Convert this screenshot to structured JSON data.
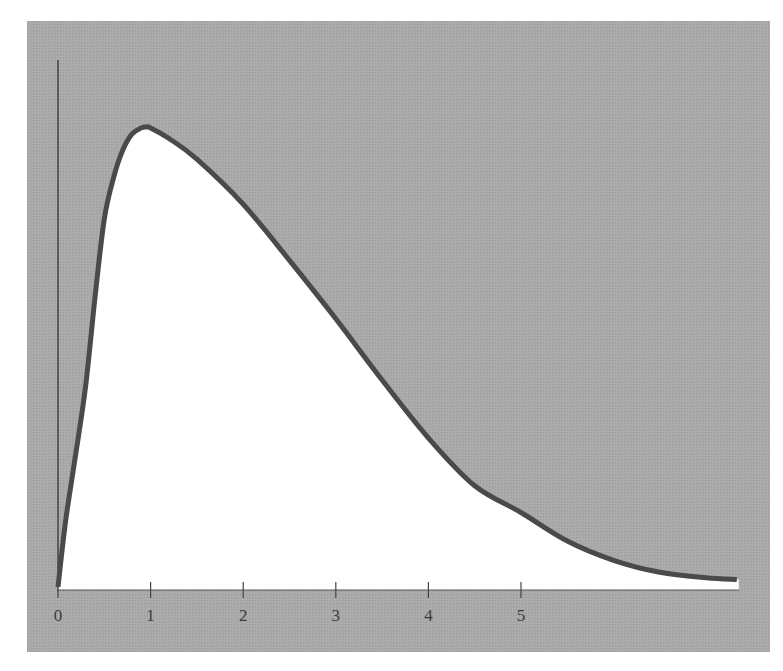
{
  "chart_data": {
    "type": "line",
    "title": "",
    "xlabel": "",
    "ylabel": "",
    "xlim": [
      0,
      7.35
    ],
    "ylim": [
      0,
      1.0
    ],
    "grid": false,
    "legend": null,
    "x_ticks": [
      0,
      1,
      2,
      3,
      4,
      5
    ],
    "x_tick_labels": [
      "0",
      "1",
      "2",
      "3",
      "4",
      "5"
    ],
    "y_ticks": [],
    "series": [
      {
        "name": "density curve (relative height, peak = 1)",
        "x": [
          0,
          0.05,
          0.1,
          0.2,
          0.3,
          0.4,
          0.5,
          0.6,
          0.7,
          0.8,
          0.9,
          0.95,
          1.0,
          1.2,
          1.5,
          2.0,
          2.5,
          3.0,
          3.5,
          4.0,
          4.5,
          5.0,
          5.5,
          6.0,
          6.5,
          7.0,
          7.33
        ],
        "y": [
          0,
          0.09,
          0.17,
          0.3,
          0.44,
          0.63,
          0.8,
          0.89,
          0.95,
          0.985,
          0.998,
          1.0,
          0.998,
          0.975,
          0.93,
          0.832,
          0.71,
          0.583,
          0.45,
          0.324,
          0.22,
          0.162,
          0.1,
          0.058,
          0.032,
          0.02,
          0.016
        ]
      }
    ],
    "fill_under_curve": "#ffffff",
    "background_color": "#a8a8a8",
    "line_color": "#4a4a4a"
  }
}
